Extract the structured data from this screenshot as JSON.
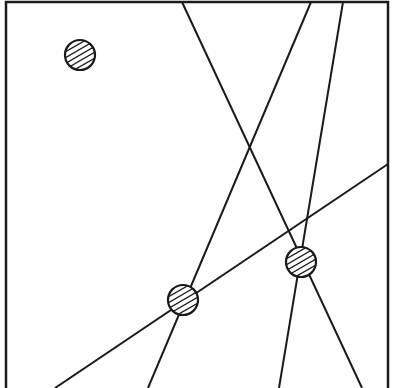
{
  "diagram": {
    "title": "",
    "stroke_color": "#1a1a1a",
    "background": "#ffffff",
    "frame": {
      "left": 6,
      "top": 2,
      "right": 388,
      "bottom": 388,
      "stroke_width": 2.5,
      "bottom_edge_visible": false
    },
    "circles": [
      {
        "id": "circle-isolated",
        "cx": 80,
        "cy": 55,
        "r": 15,
        "fill": "hatched"
      },
      {
        "id": "circle-left-junction",
        "cx": 183,
        "cy": 300,
        "r": 15,
        "fill": "hatched"
      },
      {
        "id": "circle-right-junction",
        "cx": 301,
        "cy": 262,
        "r": 15,
        "fill": "hatched"
      }
    ],
    "lines": [
      {
        "id": "line-1",
        "x1": 182,
        "y1": 2,
        "x2": 362,
        "y2": 388,
        "passes_through": "circle-right-junction"
      },
      {
        "id": "line-2",
        "x1": 311,
        "y1": 2,
        "x2": 148,
        "y2": 388,
        "passes_through": "circle-left-junction"
      },
      {
        "id": "line-3",
        "x1": 343,
        "y1": 2,
        "x2": 279,
        "y2": 388,
        "passes_through": "circle-right-junction"
      },
      {
        "id": "line-4",
        "x1": 388,
        "y1": 164,
        "x2": 55,
        "y2": 388,
        "passes_through": "circle-left-junction"
      }
    ],
    "hatch": {
      "spacing": 5,
      "angle_deg": -30,
      "stroke_width": 1.3
    }
  }
}
